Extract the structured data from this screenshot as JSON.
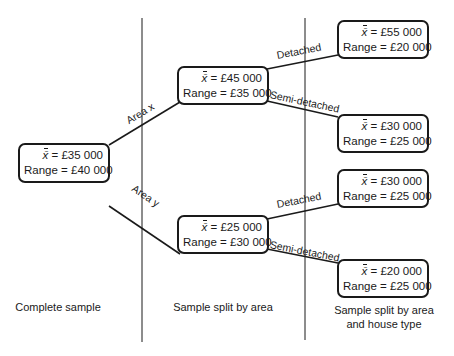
{
  "diagram": {
    "type": "tree",
    "colors": {
      "ink": "#1a1a1a",
      "background": "#ffffff"
    },
    "nodes": {
      "root": {
        "mean_label": "x̄",
        "mean": "= £35 000",
        "range": "Range = £40 000"
      },
      "area_x": {
        "mean_label": "x̄",
        "mean": "= £45 000",
        "range": "Range = £35 000"
      },
      "area_y": {
        "mean_label": "x̄",
        "mean": "= £25 000",
        "range": "Range = £30 000"
      },
      "x_detached": {
        "mean_label": "x̄",
        "mean": "= £55 000",
        "range": "Range = £20 000"
      },
      "x_semi": {
        "mean_label": "x̄",
        "mean": "= £30 000",
        "range": "Range = £25 000"
      },
      "y_detached": {
        "mean_label": "x̄",
        "mean": "= £30 000",
        "range": "Range = £25 000"
      },
      "y_semi": {
        "mean_label": "x̄",
        "mean": "= £20 000",
        "range": "Range = £25 000"
      }
    },
    "edges": {
      "area_x": "Area x",
      "area_y": "Area y",
      "x_detached": "Detached",
      "x_semi": "Semi-detached",
      "y_detached": "Detached",
      "y_semi": "Semi-detached"
    },
    "columns": {
      "col1": "Complete sample",
      "col2": "Sample split by area",
      "col3_line1": "Sample split by area",
      "col3_line2": "and house type"
    }
  }
}
